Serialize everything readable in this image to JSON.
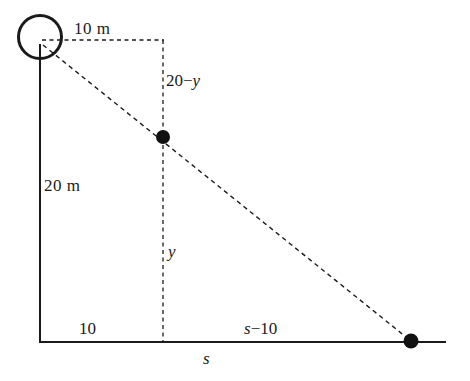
{
  "figure": {
    "kind": "geometry-diagram",
    "colors": {
      "stroke": "#1a1a1a",
      "background": "#ffffff",
      "dot_fill": "#111111"
    },
    "labels": {
      "top_horizontal": "10  m",
      "pole_height": "20  m",
      "upper_vertical": "20−",
      "upper_vertical_var": "y",
      "lower_vertical": "y",
      "ground_left": "10",
      "ground_right_var": "s",
      "ground_right_rest": "−10",
      "ground_total": "s"
    },
    "elements": {
      "lamp": "lamp-circle",
      "pole": "lamp-post",
      "ground": "ground-line",
      "ray": "light-ray",
      "person_top": "object-top-point",
      "shadow_tip": "shadow-tip-point"
    },
    "geometry": {
      "lamp_center": [
        40,
        38
      ],
      "lamp_radius": 22,
      "pole_x": 40,
      "pole_top_y": 45,
      "ground_y": 342,
      "ground_x_start": 40,
      "ground_x_end": 446,
      "dashed_vertical_x": 163,
      "dashed_top_y": 40,
      "mid_point": [
        163,
        137
      ],
      "tip_point": [
        411,
        341
      ]
    }
  }
}
